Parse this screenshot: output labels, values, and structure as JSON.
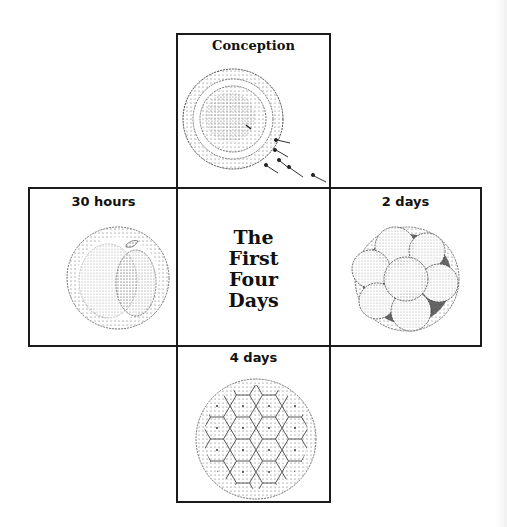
{
  "diagram": {
    "title": [
      "The",
      "First",
      "Four",
      "Days"
    ],
    "panels": [
      {
        "position": "top",
        "label": "Conception",
        "illustration": "egg-with-sperm"
      },
      {
        "position": "left",
        "label": "30 hours",
        "illustration": "two-cell-embryo"
      },
      {
        "position": "right",
        "label": "2 days",
        "illustration": "multi-cell-embryo"
      },
      {
        "position": "bottom",
        "label": "4 days",
        "illustration": "morula-blastocyst"
      }
    ],
    "colors": {
      "line": "#1a1a1a",
      "background": "#ffffff",
      "stipple": "#333333"
    }
  }
}
